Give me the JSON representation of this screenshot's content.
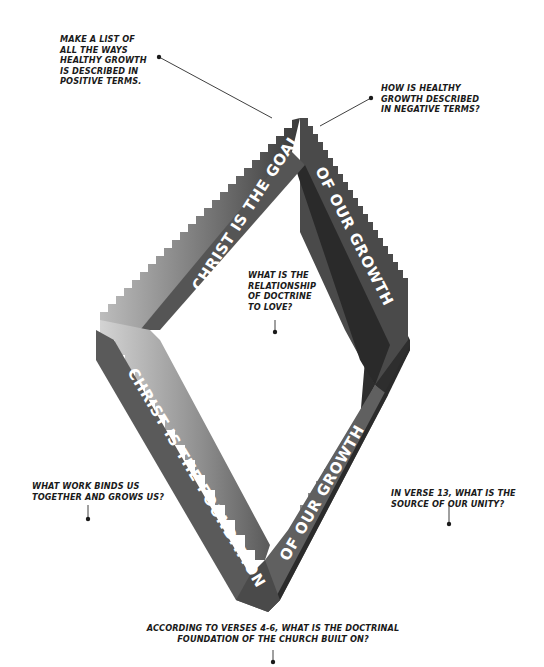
{
  "diagram": {
    "type": "impossible-diamond-staircase",
    "bands": {
      "top_left": "CHRIST IS THE GOAL",
      "top_right": "OF OUR GROWTH",
      "bottom_left": "CHRIST IS THE FOUNDATION",
      "bottom_right": "OF OUR GROWTH"
    },
    "colors": {
      "band_mid": "#5a5a5a",
      "band_dark": "#2e2e2e",
      "band_light": "#8a8a8a",
      "stair_light": "#c8c8c8",
      "text": "#1a1a1a",
      "background": "#ffffff"
    }
  },
  "questions": {
    "positive_terms": "MAKE A LIST OF\nALL THE WAYS\nHEALTHY GROWTH\nIS DESCRIBED IN\nPOSITIVE TERMS.",
    "negative_terms": "HOW IS HEALTHY\nGROWTH DESCRIBED\nIN NEGATIVE TERMS?",
    "doctrine_love": "WHAT IS THE\nRELATIONSHIP\nOF DOCTRINE\nTO LOVE?",
    "work_binds": "WHAT WORK BINDS US\nTOGETHER AND GROWS US?",
    "source_unity": "IN VERSE 13, WHAT IS THE\nSOURCE OF OUR UNITY?",
    "doctrinal_foundation": "ACCORDING TO VERSES 4-6, WHAT IS THE DOCTRINAL\nFOUNDATION OF THE CHURCH BUILT ON?"
  }
}
